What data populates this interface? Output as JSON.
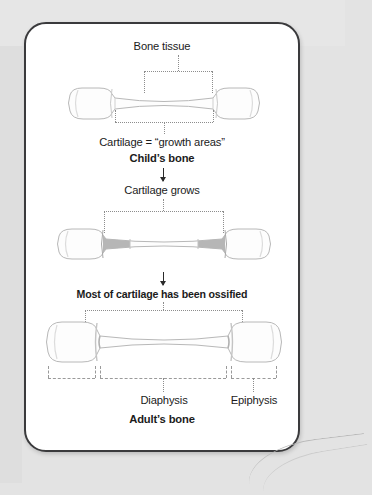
{
  "diagram": {
    "title_alt": "Bone growth from child to adult",
    "labels": {
      "bone_tissue": "Bone tissue",
      "cartilage_growth": "Cartilage = “growth areas”",
      "childs_bone": "Child’s bone",
      "cartilage_grows": "Cartilage grows",
      "ossified": "Most of cartilage has been ossified",
      "diaphysis": "Diaphysis",
      "epiphysis": "Epiphysis",
      "adults_bone": "Adult’s bone"
    },
    "stages": [
      {
        "id": "child",
        "caption": "Child’s bone",
        "cartilage_shade": "#ffffff"
      },
      {
        "id": "growing",
        "caption": "Cartilage grows",
        "cartilage_shade": "#b6b6b6"
      },
      {
        "id": "adult",
        "caption": "Adult’s bone",
        "cartilage_shade": "#d8d8d8"
      }
    ],
    "colors": {
      "card_border": "#3a3a3c",
      "card_background": "#ffffff",
      "page_background": "#e3e3e3",
      "bone_fill": "#fdfdfd",
      "bone_outline": "#b4b4b4",
      "cartilage_gray": "#b6b6b6",
      "dotted_line": "#8d8d8d",
      "arrow": "#2b2b2b",
      "text": "#1b1b1b"
    }
  }
}
